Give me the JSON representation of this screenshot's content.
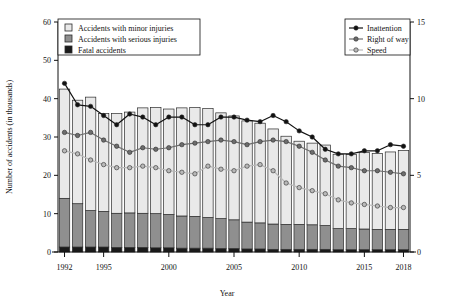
{
  "chart_data": {
    "type": "bar",
    "title": "",
    "xlabel": "Year",
    "ylabel": "Number of accidents (in thousands)",
    "ylabel_right": "",
    "ylim": [
      0,
      60
    ],
    "ylim_right": [
      0,
      15
    ],
    "yticks": [
      0,
      10,
      20,
      30,
      40,
      50,
      60
    ],
    "yticks_right": [
      0,
      5,
      10,
      15
    ],
    "xticks": [
      "1992",
      "1995",
      "2000",
      "2005",
      "2010",
      "2015",
      "2018"
    ],
    "grid": false,
    "legend_position": "top-left and top-right",
    "categories": [
      "1992",
      "1993",
      "1994",
      "1995",
      "1996",
      "1997",
      "1998",
      "1999",
      "2000",
      "2001",
      "2002",
      "2003",
      "2004",
      "2005",
      "2006",
      "2007",
      "2008",
      "2009",
      "2010",
      "2011",
      "2012",
      "2013",
      "2014",
      "2015",
      "2016",
      "2017",
      "2018"
    ],
    "stacked_series": [
      {
        "name": "Fatal accidents",
        "color": "#1a1a1a",
        "values": [
          1.3,
          1.3,
          1.3,
          1.3,
          1.2,
          1.2,
          1.2,
          1.1,
          1.1,
          1.0,
          1.0,
          1.0,
          0.9,
          0.9,
          0.8,
          0.8,
          0.7,
          0.7,
          0.7,
          0.7,
          0.7,
          0.6,
          0.6,
          0.6,
          0.6,
          0.6,
          0.6
        ]
      },
      {
        "name": "Accidents with serious injuries",
        "color": "#8f8f8f",
        "values": [
          12.7,
          11.3,
          9.5,
          9.3,
          8.9,
          9.0,
          8.9,
          8.9,
          8.7,
          8.4,
          8.3,
          8.0,
          7.8,
          7.5,
          7.0,
          6.8,
          6.6,
          6.5,
          6.5,
          6.4,
          6.2,
          5.5,
          5.5,
          5.4,
          5.3,
          5.3,
          5.3
        ]
      },
      {
        "name": "Accidents with minor injuries",
        "color": "#e9e9e9",
        "values": [
          28.5,
          27.0,
          29.6,
          25.5,
          26.0,
          26.3,
          27.5,
          27.7,
          27.5,
          28.2,
          28.4,
          28.4,
          27.6,
          27.1,
          26.4,
          26.0,
          24.8,
          23.0,
          21.7,
          21.3,
          21.0,
          19.4,
          19.3,
          20.0,
          19.8,
          20.2,
          20.6
        ]
      }
    ],
    "totals": [
      42.5,
      39.6,
      40.4,
      36.1,
      36.1,
      36.5,
      37.6,
      37.7,
      37.3,
      37.6,
      37.7,
      37.4,
      36.3,
      35.5,
      34.2,
      33.6,
      32.1,
      30.2,
      28.9,
      28.4,
      27.9,
      25.5,
      25.4,
      26.0,
      25.7,
      26.1,
      26.5
    ],
    "line_series": [
      {
        "name": "Inattention",
        "color": "#121212",
        "axis": "right",
        "values": [
          11.0,
          9.6,
          9.5,
          8.9,
          8.3,
          9.0,
          8.8,
          8.3,
          8.8,
          8.8,
          8.3,
          8.3,
          8.8,
          8.8,
          8.6,
          8.5,
          8.9,
          8.5,
          7.9,
          7.5,
          6.7,
          6.4,
          6.4,
          6.6,
          6.6,
          7.0,
          6.9
        ]
      },
      {
        "name": "Right of way",
        "color": "#6d6d6d",
        "axis": "right",
        "values": [
          7.8,
          7.6,
          7.8,
          7.3,
          6.9,
          6.5,
          6.8,
          6.7,
          6.8,
          7.0,
          7.1,
          7.2,
          7.3,
          7.2,
          7.0,
          7.2,
          7.3,
          7.2,
          6.9,
          6.5,
          6.0,
          5.6,
          5.5,
          5.3,
          5.3,
          5.2,
          5.1
        ]
      },
      {
        "name": "Speed",
        "color": "#b9b9b9",
        "axis": "right",
        "values": [
          6.6,
          6.4,
          6.0,
          5.7,
          5.5,
          5.5,
          5.6,
          5.5,
          5.3,
          5.2,
          5.1,
          5.6,
          5.4,
          5.3,
          5.6,
          5.7,
          5.3,
          4.5,
          4.2,
          4.0,
          3.8,
          3.4,
          3.2,
          3.1,
          3.0,
          2.9,
          2.9
        ]
      }
    ],
    "legend_left": {
      "items": [
        {
          "label": "Accidents with minor injuries",
          "color": "#e9e9e9"
        },
        {
          "label": "Accidents with serious injuries",
          "color": "#8f8f8f"
        },
        {
          "label": "Fatal accidents",
          "color": "#1a1a1a"
        }
      ]
    },
    "legend_right": {
      "items": [
        {
          "label": "Inattention",
          "color": "#121212"
        },
        {
          "label": "Right of way",
          "color": "#6d6d6d"
        },
        {
          "label": "Speed",
          "color": "#b9b9b9"
        }
      ]
    }
  }
}
